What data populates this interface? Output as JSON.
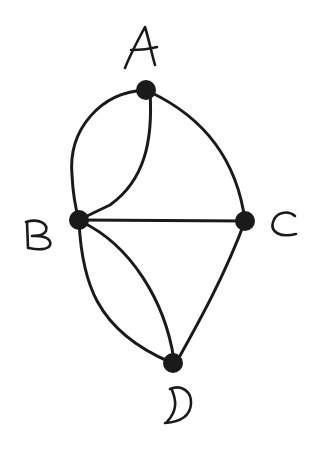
{
  "diagram": {
    "type": "multigraph",
    "nodes": [
      {
        "id": "A",
        "label": "A",
        "x": 146,
        "y": 90
      },
      {
        "id": "B",
        "label": "B",
        "x": 79,
        "y": 220
      },
      {
        "id": "C",
        "label": "C",
        "x": 245,
        "y": 221
      },
      {
        "id": "D",
        "label": "D",
        "x": 173,
        "y": 363
      }
    ],
    "edges": [
      {
        "from": "A",
        "to": "B",
        "style": "curve-left"
      },
      {
        "from": "A",
        "to": "B",
        "style": "curve-inner"
      },
      {
        "from": "A",
        "to": "C",
        "style": "curve"
      },
      {
        "from": "B",
        "to": "C",
        "style": "straight"
      },
      {
        "from": "B",
        "to": "D",
        "style": "curve-left"
      },
      {
        "from": "B",
        "to": "D",
        "style": "curve-inner"
      },
      {
        "from": "C",
        "to": "D",
        "style": "straight"
      }
    ],
    "colors": {
      "ink": "#1a1a1a",
      "background": "#ffffff"
    }
  }
}
